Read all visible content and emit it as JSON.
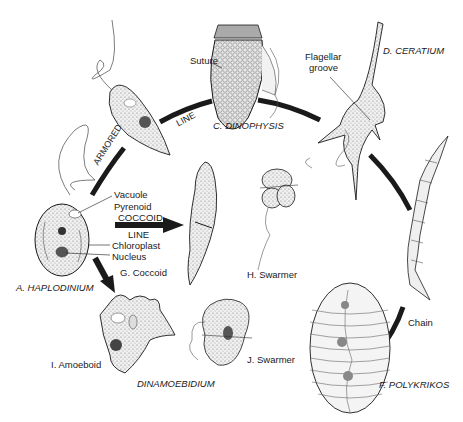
{
  "diagram": {
    "organisms": {
      "a": {
        "label": "A. HAPLODINIUM"
      },
      "c": {
        "label": "C. DINOPHYSIS"
      },
      "d": {
        "label": "D. CERATIUM"
      },
      "f": {
        "label": "F. POLYKRIKOS"
      },
      "g": {
        "label": "G. Coccoid"
      },
      "h": {
        "label": "H. Swarmer"
      },
      "i": {
        "label": "I. Amoeboid"
      },
      "j": {
        "label": "J. Swarmer"
      },
      "dinamoebidium": {
        "label": "DINAMOEBIDIUM"
      }
    },
    "parts": {
      "vacuole": "Vacuole",
      "pyrenoid": "Pyrenoid",
      "chloroplast": "Chloroplast",
      "nucleus": "Nucleus",
      "suture": "Suture",
      "flagellar_groove_1": "Flagellar",
      "flagellar_groove_2": "groove"
    },
    "lines": {
      "armored": "ARMORED",
      "armored_line": "LINE",
      "coccoid": "COCCOID",
      "coccoid_line": "LINE",
      "chain": "Chain"
    },
    "colors": {
      "ink": "#1a1a1a",
      "cell_fill": "#e6e6e6",
      "background": "#ffffff"
    }
  }
}
